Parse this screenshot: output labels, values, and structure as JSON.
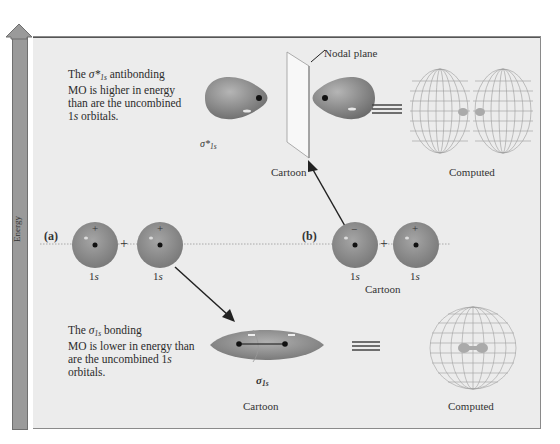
{
  "axis": {
    "label": "Energy"
  },
  "antibonding": {
    "description_lines": [
      "The σ*1s antibonding",
      "MO is higher in energy",
      "than are the uncombined",
      "1s orbitals."
    ],
    "description_parts": {
      "prefix": "The ",
      "symbol": "σ*",
      "subscript": "1s",
      "suffix": " antibonding",
      "line2": "MO is higher in energy",
      "line3": "than are the uncombined",
      "line4_num": "1",
      "line4_s": "s",
      "line4_rest": " orbitals."
    },
    "symbol": "σ*",
    "symbol_subscript": "1s",
    "nodal_plane_label": "Nodal plane",
    "cartoon_label": "Cartoon",
    "computed_label": "Computed",
    "equals": "≡"
  },
  "part_a": {
    "label": "(a)",
    "orbitals": [
      {
        "sign": "+",
        "label_num": "1",
        "label_s": "s"
      },
      {
        "sign": "+",
        "label_num": "1",
        "label_s": "s"
      }
    ],
    "plus": "+"
  },
  "part_b": {
    "label": "(b)",
    "orbitals": [
      {
        "sign": "−",
        "label_num": "1",
        "label_s": "s"
      },
      {
        "sign": "+",
        "label_num": "1",
        "label_s": "s"
      }
    ],
    "plus": "+",
    "caption": "Cartoon"
  },
  "bonding": {
    "description_parts": {
      "prefix": "The ",
      "symbol": "σ",
      "subscript": "1s",
      "suffix": " bonding",
      "line2": "MO is lower in energy than",
      "line3_pre": "are the uncombined ",
      "line3_num": "1",
      "line3_s": "s",
      "line4": "orbitals."
    },
    "symbol": "σ",
    "symbol_subscript": "1s",
    "cartoon_label": "Cartoon",
    "computed_label": "Computed",
    "equals": "≡"
  },
  "colors": {
    "panel": "#ececec",
    "orbital": "#8e8e8e",
    "energy_bar": "#9a9a9a",
    "text": "#2b2b2b"
  }
}
